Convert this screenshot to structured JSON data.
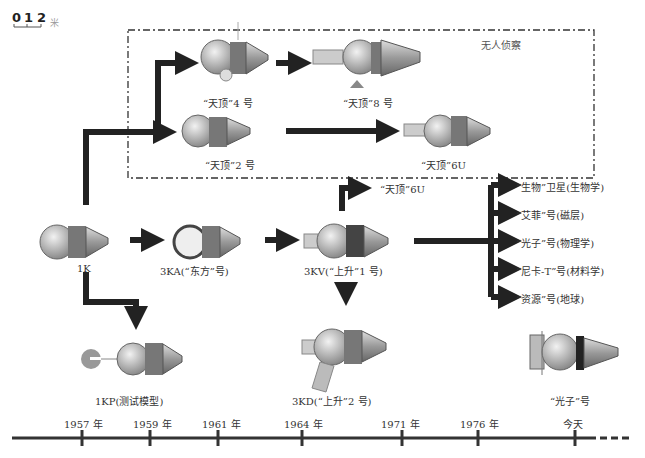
{
  "scale": {
    "ticks": [
      "0",
      "1",
      "2"
    ],
    "unit": "米"
  },
  "region_label": "无人侦察",
  "spacecraft": {
    "zenit4": "“天顶”4 号",
    "zenit8": "“天顶”8 号",
    "zenit2": "“天顶”2 号",
    "zenit6u_box": "“天顶”6U",
    "k1": "1K",
    "ka3": "3KA(“东方”号)",
    "kv3": "3KV(“上升”1 号)",
    "zenit6u_branch": "“天顶”6U",
    "kp1": "1KP(测试模型)",
    "kd3": "3KD(“上升”2 号)",
    "foton": "“光子”号"
  },
  "branches": [
    "“生物”卫星(生物学)",
    "“艾菲”号(磁层)",
    "“光子”号(物理学)",
    "“尼卡-T”号(材料学)",
    "“资源”号(地球)"
  ],
  "timeline": [
    "1957 年",
    "1959 年",
    "1961 年",
    "1964 年",
    "1971 年",
    "1976 年",
    "今天"
  ],
  "colors": {
    "arrow": "#222222",
    "capsule": "#b8b8b8",
    "line": "#333333"
  }
}
